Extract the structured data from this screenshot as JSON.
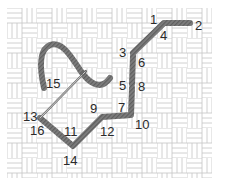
{
  "diagram": {
    "type": "needlepoint-stitch-sequence",
    "canvas": {
      "pattern": "basketweave-grid",
      "line_color": "#c8c8c8",
      "background": "#ffffff"
    },
    "thread": {
      "color": "#7a7a7a",
      "stripe_color": "#5a5a5a"
    },
    "needle": {
      "color": "#8a8a8a"
    },
    "labels": [
      {
        "id": "1",
        "text": "1",
        "x": 150,
        "y": 13
      },
      {
        "id": "2",
        "text": "2",
        "x": 195,
        "y": 19
      },
      {
        "id": "3",
        "text": "3",
        "x": 119,
        "y": 46
      },
      {
        "id": "4",
        "text": "4",
        "x": 160,
        "y": 29
      },
      {
        "id": "5",
        "text": "5",
        "x": 119,
        "y": 79
      },
      {
        "id": "6",
        "text": "6",
        "x": 138,
        "y": 56
      },
      {
        "id": "7",
        "text": "7",
        "x": 118,
        "y": 101
      },
      {
        "id": "8",
        "text": "8",
        "x": 138,
        "y": 80
      },
      {
        "id": "9",
        "text": "9",
        "x": 90,
        "y": 102
      },
      {
        "id": "10",
        "text": "10",
        "x": 135,
        "y": 118
      },
      {
        "id": "11",
        "text": "11",
        "x": 64,
        "y": 125
      },
      {
        "id": "12",
        "text": "12",
        "x": 100,
        "y": 125
      },
      {
        "id": "13",
        "text": "13",
        "x": 23,
        "y": 110
      },
      {
        "id": "14",
        "text": "14",
        "x": 63,
        "y": 154
      },
      {
        "id": "15",
        "text": "15",
        "x": 46,
        "y": 77
      },
      {
        "id": "16",
        "text": "16",
        "x": 30,
        "y": 124
      }
    ]
  }
}
